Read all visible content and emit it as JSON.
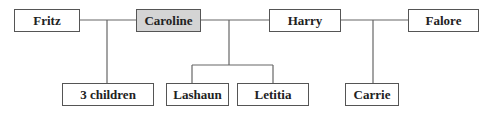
{
  "diagram": {
    "type": "family-tree",
    "nodes": [
      {
        "id": "fritz",
        "label": "Fritz",
        "highlighted": false
      },
      {
        "id": "caroline",
        "label": "Caroline",
        "highlighted": true
      },
      {
        "id": "harry",
        "label": "Harry",
        "highlighted": false
      },
      {
        "id": "falore",
        "label": "Falore",
        "highlighted": false
      },
      {
        "id": "three_children",
        "label": "3 children",
        "highlighted": false
      },
      {
        "id": "lashaun",
        "label": "Lashaun",
        "highlighted": false
      },
      {
        "id": "letitia",
        "label": "Letitia",
        "highlighted": false
      },
      {
        "id": "carrie",
        "label": "Carrie",
        "highlighted": false
      }
    ],
    "relationships": [
      {
        "partners": [
          "Fritz",
          "Caroline"
        ],
        "children": [
          "3 children"
        ]
      },
      {
        "partners": [
          "Caroline",
          "Harry"
        ],
        "children": [
          "Lashaun",
          "Letitia"
        ]
      },
      {
        "partners": [
          "Harry",
          "Falore"
        ],
        "children": [
          "Carrie"
        ]
      }
    ],
    "colors": {
      "highlight_fill": "#d4d4d4",
      "border": "#555555",
      "line": "#666666"
    }
  }
}
